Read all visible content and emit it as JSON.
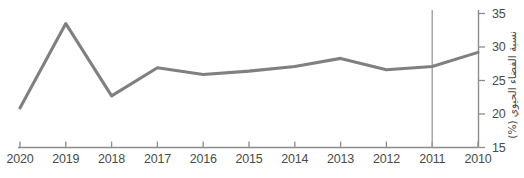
{
  "chart_data": {
    "type": "line",
    "title": "",
    "subtitle": "",
    "xlabel": "",
    "ylabel": "نسبة الفضاء الحيوي (%)",
    "categories": [
      "2020",
      "2019",
      "2018",
      "2017",
      "2016",
      "2015",
      "2014",
      "2013",
      "2012",
      "2011",
      "2010"
    ],
    "x": [
      2020,
      2019,
      2018,
      2017,
      2016,
      2015,
      2014,
      2013,
      2012,
      2011,
      2010
    ],
    "values": [
      20.9,
      33.5,
      22.7,
      26.9,
      25.9,
      26.4,
      27.1,
      28.3,
      26.6,
      27.1,
      29.2
    ],
    "series": [
      {
        "name": "نسبة الفضاء الحيوي (%)",
        "values": [
          20.9,
          33.5,
          22.7,
          26.9,
          25.9,
          26.4,
          27.1,
          28.3,
          26.6,
          27.1,
          29.2
        ],
        "color": "#808080"
      }
    ],
    "x_tick_labels": [
      "2020",
      "2019",
      "2018",
      "2017",
      "2016",
      "2015",
      "2014",
      "2013",
      "2012",
      "2011",
      "2010"
    ],
    "y_tick_labels": [
      "35",
      "30",
      "25",
      "20",
      "15"
    ],
    "y_ticks": [
      35,
      30,
      25,
      20,
      15
    ],
    "ylim": [
      15,
      35
    ],
    "x_axis_reversed": true,
    "grid": false,
    "legend": false,
    "legend_position": "none",
    "y_axis_position": "right",
    "annotations": [
      {
        "type": "vertical-reference-line",
        "at_category": "2011",
        "color": "#9a9a9a",
        "label": ""
      }
    ],
    "colors": {
      "line": "#808080",
      "axis": "#8c8c8c",
      "text": "#4a4a4a",
      "reference_line": "#9a9a9a",
      "background": "#ffffff"
    }
  },
  "axis": {
    "y_title": "نسبة الفضاء الحيوي (%)"
  }
}
